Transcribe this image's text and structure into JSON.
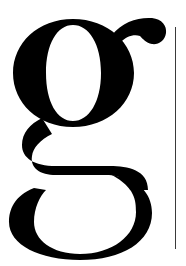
{
  "glyph": {
    "character": "g",
    "description": "Large serif lowercase letter g",
    "color": "#000000"
  },
  "rule": {
    "color": "#3a3a3a"
  },
  "background": "#ffffff"
}
